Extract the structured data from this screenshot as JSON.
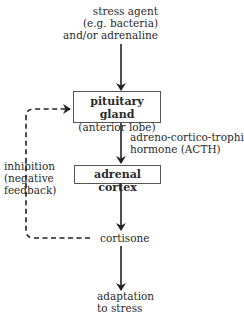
{
  "diagram": {
    "nodes": {
      "stress_agent": [
        "stress agent",
        "(e.g. bacteria)",
        "and/or adrenaline"
      ],
      "pituitary": {
        "name": "pituitary gland",
        "sub": "(anterior lobe)"
      },
      "acth_label": [
        "adreno-cortico-trophic",
        "hormone (ACTH)"
      ],
      "adrenal": {
        "name": "adrenal cortex"
      },
      "cortisone": "cortisone",
      "adaptation": [
        "adaptation",
        "to stress"
      ],
      "inhibition": [
        "inhibition",
        "(negative",
        "feedback)"
      ]
    },
    "edges": [
      {
        "from": "stress_agent",
        "to": "pituitary",
        "style": "solid"
      },
      {
        "from": "pituitary",
        "to": "adrenal",
        "style": "solid",
        "label": "acth_label"
      },
      {
        "from": "adrenal",
        "to": "cortisone",
        "style": "solid"
      },
      {
        "from": "cortisone",
        "to": "adaptation",
        "style": "solid"
      },
      {
        "from": "cortisone",
        "to": "pituitary",
        "style": "dashed",
        "label": "inhibition"
      }
    ]
  }
}
